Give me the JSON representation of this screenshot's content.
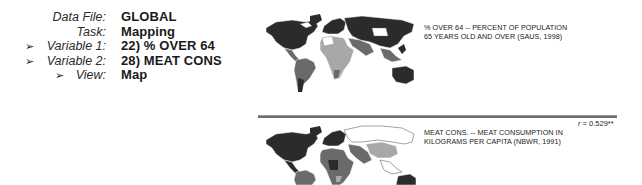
{
  "info_panel": {
    "rows": [
      {
        "label": "Data File:",
        "value": "GLOBAL",
        "selected": false
      },
      {
        "label": "Task:",
        "value": "Mapping",
        "selected": false
      },
      {
        "label": "Variable 1:",
        "value": "22) % OVER 64",
        "selected": true
      },
      {
        "label": "Variable 2:",
        "value": "28) MEAT CONS",
        "selected": true
      },
      {
        "label": "View:",
        "value": "Map",
        "selected": true
      }
    ],
    "arrow_glyph": "➢"
  },
  "maps": [
    {
      "id": "variable-1-map",
      "caption_line1": "% OVER 64 -- PERCENT OF POPULATION",
      "caption_line2": "65 YEARS OLD AND OVER (SAUS, 1998)"
    },
    {
      "id": "variable-2-map",
      "caption_line1": "MEAT CONS. -- MEAT CONSUMPTION IN",
      "caption_line2": "KILOGRAMS PER CAPITA (NBWR, 1991)",
      "correlation_label": "r",
      "correlation_value": "= 0.529**"
    }
  ],
  "colors": {
    "dark": "#2b2b2b",
    "mid": "#6a6a6a",
    "light": "#a8a8a8",
    "white": "#ffffff",
    "separator": "#6e6e6e"
  }
}
